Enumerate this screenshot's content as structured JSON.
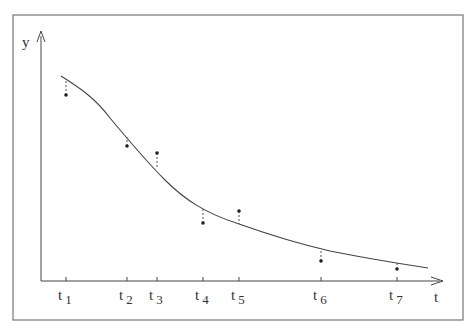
{
  "diagram": {
    "title": "",
    "axes": {
      "y_label": "y",
      "x_label": "t"
    },
    "ticks": [
      {
        "base": "t",
        "sub": "1",
        "x": 66
      },
      {
        "base": "t",
        "sub": "2",
        "x": 127
      },
      {
        "base": "t",
        "sub": "3",
        "x": 157
      },
      {
        "base": "t",
        "sub": "4",
        "x": 203
      },
      {
        "base": "t",
        "sub": "5",
        "x": 239
      },
      {
        "base": "t",
        "sub": "6",
        "x": 321
      },
      {
        "base": "t",
        "sub": "7",
        "x": 397
      }
    ],
    "points": [
      {
        "x": 66,
        "y": 95,
        "curve_y": 81
      },
      {
        "x": 127,
        "y": 146,
        "curve_y": 137
      },
      {
        "x": 157,
        "y": 153,
        "curve_y": 167
      },
      {
        "x": 203,
        "y": 223,
        "curve_y": 208
      },
      {
        "x": 239,
        "y": 211,
        "curve_y": 224
      },
      {
        "x": 321,
        "y": 261,
        "curve_y": 250
      },
      {
        "x": 397,
        "y": 269,
        "curve_y": 262
      }
    ]
  }
}
